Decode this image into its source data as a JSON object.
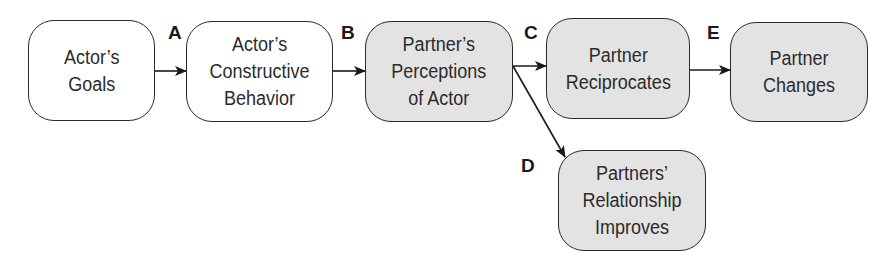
{
  "diagram": {
    "nodes": [
      {
        "id": "actors-goals",
        "label": "Actor’s\nGoals",
        "fill": "#ffffff"
      },
      {
        "id": "actors-constructive-behavior",
        "label": "Actor’s\nConstructive\nBehavior",
        "fill": "#ffffff"
      },
      {
        "id": "partners-perceptions",
        "label": "Partner’s\nPerceptions\nof Actor",
        "fill": "#e3e3e3"
      },
      {
        "id": "partner-reciprocates",
        "label": "Partner\nReciprocates",
        "fill": "#e3e3e3"
      },
      {
        "id": "partner-changes",
        "label": "Partner\nChanges",
        "fill": "#e3e3e3"
      },
      {
        "id": "relationship-improves",
        "label": "Partners’\nRelationship\nImproves",
        "fill": "#e3e3e3"
      }
    ],
    "edges": [
      {
        "label": "A",
        "from": "actors-goals",
        "to": "actors-constructive-behavior"
      },
      {
        "label": "B",
        "from": "actors-constructive-behavior",
        "to": "partners-perceptions"
      },
      {
        "label": "C",
        "from": "partners-perceptions",
        "to": "partner-reciprocates"
      },
      {
        "label": "D",
        "from": "partners-perceptions",
        "to": "relationship-improves"
      },
      {
        "label": "E",
        "from": "partner-reciprocates",
        "to": "partner-changes"
      }
    ]
  }
}
